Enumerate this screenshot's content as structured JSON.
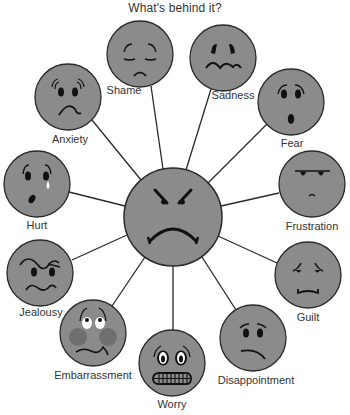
{
  "title": "What's behind it?",
  "colors": {
    "face_fill": "#8b8b8b",
    "outline": "#2a2a2a",
    "cheek": "#6f6f6f",
    "eye_white": "#ffffff",
    "text": "#333333"
  },
  "center": {
    "emotion": "Anger",
    "cx": 173,
    "cy": 217,
    "r": 49
  },
  "emotions": [
    {
      "id": "shame",
      "label": "Shame",
      "cx": 140,
      "cy": 54,
      "label_x": 124,
      "label_y": 92
    },
    {
      "id": "sadness",
      "label": "Sadness",
      "cx": 223,
      "cy": 58,
      "label_x": 233,
      "label_y": 97
    },
    {
      "id": "anxiety",
      "label": "Anxiety",
      "cx": 68,
      "cy": 97,
      "label_x": 70,
      "label_y": 134
    },
    {
      "id": "fear",
      "label": "Fear",
      "cx": 291,
      "cy": 102,
      "label_x": 292,
      "label_y": 138
    },
    {
      "id": "hurt",
      "label": "Hurt",
      "cx": 37,
      "cy": 184,
      "label_x": 37,
      "label_y": 219
    },
    {
      "id": "frustration",
      "label": "Frustration",
      "cx": 312,
      "cy": 184,
      "label_x": 312,
      "label_y": 221
    },
    {
      "id": "jealousy",
      "label": "Jealousy",
      "cx": 40,
      "cy": 273,
      "label_x": 41,
      "label_y": 306
    },
    {
      "id": "guilt",
      "label": "Guilt",
      "cx": 308,
      "cy": 275,
      "label_x": 308,
      "label_y": 311
    },
    {
      "id": "embarrassment",
      "label": "Embarrassment",
      "cx": 93,
      "cy": 333,
      "label_x": 93,
      "label_y": 369
    },
    {
      "id": "disappointment",
      "label": "Disappointment",
      "cx": 253,
      "cy": 338,
      "label_x": 256,
      "label_y": 374
    },
    {
      "id": "worry",
      "label": "Worry",
      "cx": 172,
      "cy": 363,
      "label_x": 172,
      "label_y": 398
    }
  ]
}
